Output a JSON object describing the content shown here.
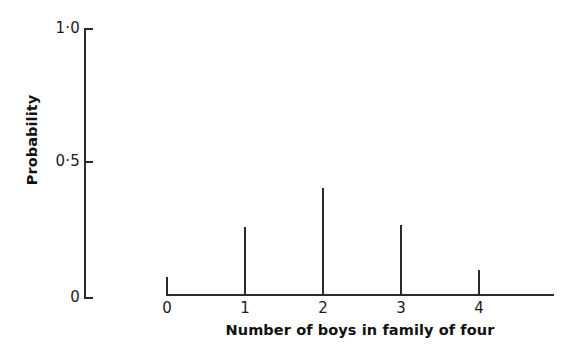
{
  "chart_data": {
    "type": "bar",
    "title": "",
    "subtitle": "",
    "xlabel": "Number of boys in family of four",
    "ylabel": "Probability",
    "categories": [
      "0",
      "1",
      "2",
      "3",
      "4"
    ],
    "x": [
      0,
      1,
      2,
      3,
      4
    ],
    "values": [
      0,
      0.25,
      0.4,
      0.26,
      0.09
    ],
    "xlim": [
      0,
      5
    ],
    "ylim": [
      0,
      1.0
    ],
    "x_tick_labels": [
      "0",
      "1",
      "2",
      "3",
      "4"
    ],
    "y_tick_labels": [
      "0",
      "0·5",
      "1·0"
    ],
    "y_tick_values": [
      0,
      0.5,
      1.0
    ],
    "grid": false,
    "legend": null,
    "annotations": [],
    "style": {
      "line_color": "#2b2b2b",
      "text_color": "#111111",
      "background": "#ffffff",
      "spike_width_px": 2
    }
  },
  "axes": {
    "y_axis_name": "probability-axis",
    "x_axis_name": "number-of-boys-axis"
  }
}
